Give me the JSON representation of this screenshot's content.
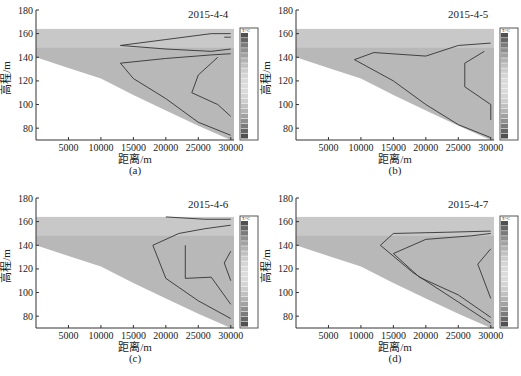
{
  "chart_data": [
    {
      "type": "heatmap",
      "panel": "(a)",
      "title": "2015-4-4",
      "xlabel": "距离/m",
      "ylabel": "高程/m",
      "xticks": [
        5000,
        10000,
        15000,
        20000,
        25000,
        30000
      ],
      "yticks": [
        80,
        100,
        120,
        140,
        160,
        180
      ],
      "xlim": [
        0,
        30500
      ],
      "ylim": [
        70,
        180
      ],
      "legend_title": "T/°C",
      "legend_range": [
        10,
        30
      ],
      "water_surface": 164,
      "bed_profile": [
        [
          0,
          140
        ],
        [
          5000,
          131
        ],
        [
          10000,
          122
        ],
        [
          15000,
          108
        ],
        [
          20000,
          95
        ],
        [
          25000,
          82
        ],
        [
          30000,
          70
        ]
      ],
      "contours": [
        [
          [
            29000,
            157
          ],
          [
            30000,
            157
          ]
        ],
        [
          [
            13000,
            150
          ],
          [
            20000,
            155
          ],
          [
            27000,
            160
          ],
          [
            30000,
            160
          ]
        ],
        [
          [
            13000,
            150
          ],
          [
            20000,
            147
          ],
          [
            27000,
            145
          ],
          [
            30000,
            147
          ]
        ],
        [
          [
            13000,
            135
          ],
          [
            20000,
            139
          ],
          [
            27000,
            142
          ],
          [
            30000,
            143
          ]
        ],
        [
          [
            13000,
            135
          ],
          [
            15000,
            122
          ],
          [
            20000,
            105
          ],
          [
            25000,
            85
          ],
          [
            30000,
            74
          ]
        ],
        [
          [
            28000,
            140
          ],
          [
            25000,
            125
          ],
          [
            24000,
            110
          ],
          [
            28000,
            100
          ],
          [
            30000,
            90
          ]
        ]
      ]
    },
    {
      "type": "heatmap",
      "panel": "(b)",
      "title": "2015-4-5",
      "xlabel": "距离/m",
      "ylabel": "高程/m",
      "xticks": [
        5000,
        10000,
        15000,
        20000,
        25000,
        30000
      ],
      "yticks": [
        80,
        100,
        120,
        140,
        160,
        180
      ],
      "xlim": [
        0,
        30500
      ],
      "ylim": [
        70,
        180
      ],
      "legend_title": "T/°C",
      "legend_range": [
        10,
        30
      ],
      "water_surface": 164,
      "bed_profile": [
        [
          0,
          140
        ],
        [
          5000,
          131
        ],
        [
          10000,
          122
        ],
        [
          15000,
          108
        ],
        [
          20000,
          95
        ],
        [
          25000,
          82
        ],
        [
          30000,
          70
        ]
      ],
      "contours": [
        [
          [
            9000,
            138
          ],
          [
            12000,
            144
          ],
          [
            20000,
            141
          ],
          [
            25000,
            150
          ],
          [
            30000,
            152
          ]
        ],
        [
          [
            9000,
            138
          ],
          [
            15000,
            120
          ],
          [
            20000,
            100
          ],
          [
            25000,
            83
          ],
          [
            30000,
            72
          ]
        ],
        [
          [
            29000,
            145
          ],
          [
            26000,
            135
          ],
          [
            26000,
            115
          ],
          [
            30000,
            100
          ],
          [
            30000,
            87
          ]
        ]
      ]
    },
    {
      "type": "heatmap",
      "panel": "(c)",
      "title": "2015-4-6",
      "xlabel": "距离/m",
      "ylabel": "高程/m",
      "xticks": [
        5000,
        10000,
        15000,
        20000,
        25000,
        30000
      ],
      "yticks": [
        80,
        100,
        120,
        140,
        160,
        180
      ],
      "xlim": [
        0,
        30500
      ],
      "ylim": [
        70,
        180
      ],
      "legend_title": "T/°C",
      "legend_range": [
        10,
        30
      ],
      "water_surface": 164,
      "bed_profile": [
        [
          0,
          140
        ],
        [
          5000,
          131
        ],
        [
          10000,
          122
        ],
        [
          15000,
          108
        ],
        [
          20000,
          95
        ],
        [
          25000,
          82
        ],
        [
          30000,
          70
        ]
      ],
      "contours": [
        [
          [
            20000,
            164
          ],
          [
            26000,
            162
          ],
          [
            30000,
            162
          ]
        ],
        [
          [
            18000,
            140
          ],
          [
            22000,
            150
          ],
          [
            26000,
            154
          ],
          [
            30000,
            157
          ]
        ],
        [
          [
            18000,
            140
          ],
          [
            20000,
            112
          ],
          [
            25000,
            93
          ],
          [
            30000,
            78
          ]
        ],
        [
          [
            23000,
            140
          ],
          [
            23000,
            112
          ],
          [
            27000,
            113
          ],
          [
            30000,
            90
          ]
        ],
        [
          [
            30000,
            135
          ],
          [
            29000,
            125
          ],
          [
            30000,
            110
          ]
        ]
      ]
    },
    {
      "type": "heatmap",
      "panel": "(d)",
      "title": "2015-4-7",
      "xlabel": "距离/m",
      "ylabel": "高程/m",
      "xticks": [
        5000,
        10000,
        15000,
        20000,
        25000,
        30000
      ],
      "yticks": [
        80,
        100,
        120,
        140,
        160,
        180
      ],
      "xlim": [
        0,
        30500
      ],
      "ylim": [
        70,
        180
      ],
      "legend_title": "T/°C",
      "legend_range": [
        10,
        30
      ],
      "water_surface": 164,
      "bed_profile": [
        [
          0,
          140
        ],
        [
          5000,
          131
        ],
        [
          10000,
          122
        ],
        [
          15000,
          108
        ],
        [
          20000,
          95
        ],
        [
          25000,
          82
        ],
        [
          30000,
          70
        ]
      ],
      "contours": [
        [
          [
            13000,
            140
          ],
          [
            15000,
            150
          ],
          [
            23000,
            151
          ],
          [
            30000,
            152
          ]
        ],
        [
          [
            13000,
            140
          ],
          [
            18000,
            117
          ],
          [
            25000,
            92
          ],
          [
            30000,
            74
          ]
        ],
        [
          [
            15000,
            133
          ],
          [
            20000,
            145
          ],
          [
            27000,
            148
          ],
          [
            30000,
            150
          ]
        ],
        [
          [
            15000,
            133
          ],
          [
            19000,
            113
          ],
          [
            25000,
            98
          ],
          [
            30000,
            79
          ]
        ],
        [
          [
            30000,
            137
          ],
          [
            28000,
            124
          ],
          [
            30000,
            95
          ]
        ]
      ]
    }
  ],
  "panels": [
    {
      "date": "2015-4-4",
      "label": "(a)",
      "xlabel": "距离/m",
      "ylabel": "高程/m",
      "legend_unit": "T/°C"
    },
    {
      "date": "2015-4-5",
      "label": "(b)",
      "xlabel": "距离/m",
      "ylabel": "高程/m",
      "legend_unit": "T/°C"
    },
    {
      "date": "2015-4-6",
      "label": "(c)",
      "xlabel": "距离/m",
      "ylabel": "高程/m",
      "legend_unit": "T/°C"
    },
    {
      "date": "2015-4-7",
      "label": "(d)",
      "xlabel": "距离/m",
      "ylabel": "高程/m",
      "legend_unit": "T/°C"
    }
  ],
  "ticks": {
    "x": [
      "5000",
      "10000",
      "15000",
      "20000",
      "25000",
      "30000"
    ],
    "y": [
      "180",
      "160",
      "140",
      "120",
      "100",
      "80"
    ]
  }
}
